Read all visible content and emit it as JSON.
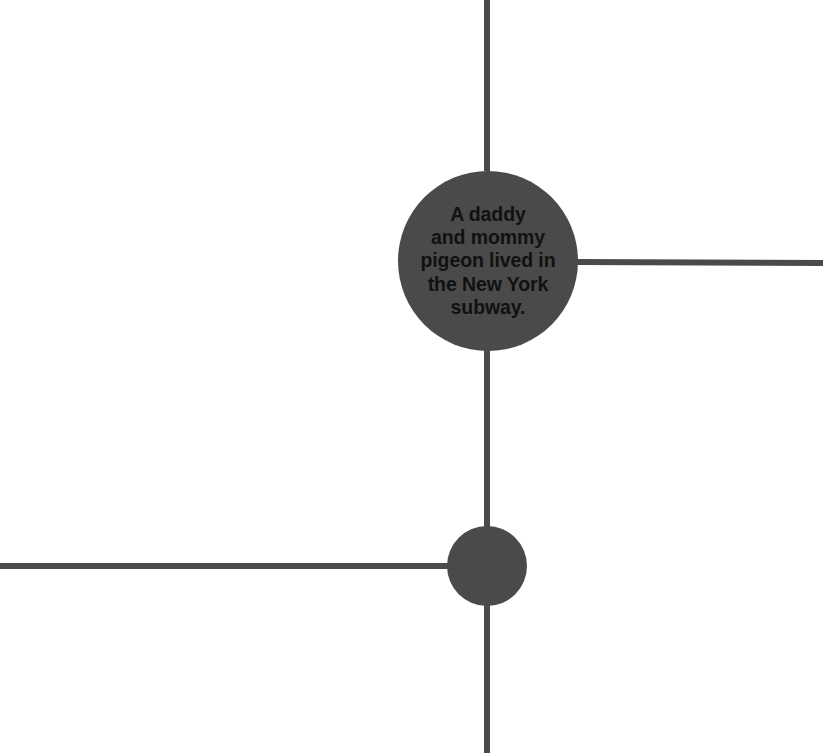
{
  "canvas": {
    "width": 823,
    "height": 753,
    "background_color": "#ffffff"
  },
  "palette": {
    "node_fill": "#4a4a4a",
    "edge_stroke": "#4a4a4a",
    "label_text": "#111111"
  },
  "nodes": [
    {
      "id": "node-main",
      "name": "main-story-node",
      "cx": 488,
      "cy": 261,
      "r": 90,
      "fill": "#4a4a4a",
      "label": "A daddy\nand mommy\npigeon lived in\nthe New York\nsubway.",
      "label_lines": [
        "A daddy",
        "and mommy",
        "pigeon lived in",
        "the New York",
        "subway."
      ]
    },
    {
      "id": "node-secondary",
      "name": "secondary-node",
      "cx": 487,
      "cy": 566,
      "r": 40,
      "fill": "#4a4a4a",
      "label": "",
      "label_lines": []
    }
  ],
  "edges": [
    {
      "id": "edge-top",
      "name": "edge-top-stub",
      "x1": 487,
      "y1": 0,
      "x2": 487,
      "y2": 171,
      "width": 6,
      "stroke": "#4a4a4a"
    },
    {
      "id": "edge-right",
      "name": "edge-right-stub",
      "x1": 576,
      "y1": 262,
      "x2": 823,
      "y2": 263,
      "width": 6,
      "stroke": "#4a4a4a"
    },
    {
      "id": "edge-main-to-secondary",
      "name": "edge-main-to-secondary",
      "x1": 487,
      "y1": 350,
      "x2": 487,
      "y2": 530,
      "width": 6,
      "stroke": "#4a4a4a"
    },
    {
      "id": "edge-left",
      "name": "edge-left-stub",
      "x1": 0,
      "y1": 566,
      "x2": 450,
      "y2": 566,
      "width": 6,
      "stroke": "#4a4a4a"
    },
    {
      "id": "edge-bottom",
      "name": "edge-bottom-stub",
      "x1": 487,
      "y1": 602,
      "x2": 487,
      "y2": 753,
      "width": 6,
      "stroke": "#4a4a4a"
    }
  ],
  "chart_data": {
    "type": "diagram",
    "title": "",
    "subtitle": "",
    "layout": "node-link graph, partial view cropped at canvas edges",
    "node_count": 2,
    "edge_count": 5,
    "annotations": [
      "A daddy and mommy pigeon lived in the New York subway."
    ]
  }
}
